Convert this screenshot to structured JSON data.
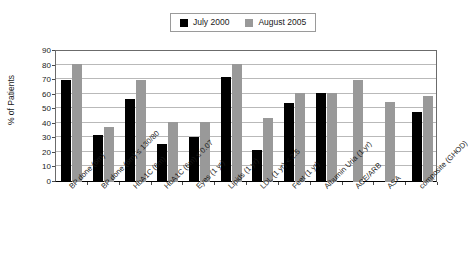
{
  "chart_data": {
    "type": "bar",
    "title": "",
    "subtitle": "",
    "xlabel": "",
    "ylabel": "% of Patients",
    "ylim": [
      0,
      90
    ],
    "y_ticks": [
      0,
      10,
      20,
      30,
      40,
      50,
      60,
      70,
      80,
      90
    ],
    "grid": true,
    "legend_position": "top-center",
    "categories": [
      "BP done (6m)",
      "BP done (6m) ≤ 130/80",
      "HbA1C (6m)",
      "HbA1C (6m) ≤ 0.07",
      "Eyes (1 yr)",
      "Lipids (1 yr)",
      "LDL (1 yr) < 2.5",
      "Feet (1 yr)",
      "Albumin Uria (1 yr)",
      "ACE/ARB",
      "ASA",
      "composite (GHOD)"
    ],
    "series": [
      {
        "name": "July 2000",
        "color": "#000000",
        "values": [
          70,
          32,
          57,
          26,
          31,
          72,
          22,
          54,
          61,
          null,
          null,
          48
        ]
      },
      {
        "name": "August 2005",
        "color": "#999999",
        "values": [
          81,
          38,
          70,
          41,
          41,
          81,
          44,
          61,
          61,
          70,
          55,
          59
        ]
      }
    ]
  },
  "legend": {
    "entries": [
      {
        "label": "July 2000",
        "swatch": "legend-swatch-black"
      },
      {
        "label": "August 2005",
        "swatch": "legend-swatch-gray"
      }
    ]
  },
  "axes": {
    "y_title": "% of Patients"
  }
}
